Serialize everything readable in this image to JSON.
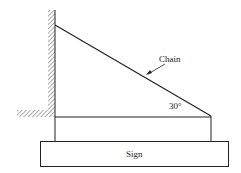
{
  "diagram": {
    "labels": {
      "chain": "Chain",
      "angle": "30°",
      "sign": "Sign"
    },
    "colors": {
      "line": "#222222",
      "hatch": "#555555",
      "background": "#ffffff"
    }
  }
}
